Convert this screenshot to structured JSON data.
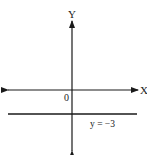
{
  "diagram": {
    "type": "coordinate-axes",
    "x_axis_label": "X",
    "y_axis_label": "Y",
    "origin_label": "0",
    "line_label": "y = −3",
    "line_equation": "y = -3",
    "colors": {
      "stroke": "#1a1a1a",
      "background": "#ffffff"
    }
  }
}
